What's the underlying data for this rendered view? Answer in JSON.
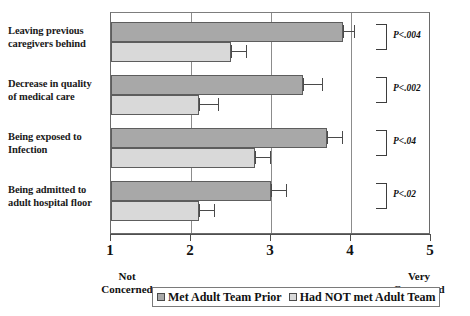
{
  "chart_data": {
    "type": "bar",
    "orientation": "horizontal",
    "title": "",
    "xlabel": "",
    "ylabel": "",
    "xlim": [
      1,
      5
    ],
    "xticks": [
      1,
      2,
      3,
      4,
      5
    ],
    "xtick_labels": [
      "1",
      "2",
      "3",
      "4",
      "5"
    ],
    "grid": true,
    "legend_position": "bottom",
    "categories": [
      "Leaving previous caregivers behind",
      "Decrease in quality of medical care",
      "Being exposed to Infection",
      "Being admitted to adult hospital floor"
    ],
    "category_label_lines": [
      [
        "Leaving previous",
        "caregivers behind"
      ],
      [
        "Decrease in quality",
        "of medical care"
      ],
      [
        "Being exposed to",
        "Infection"
      ],
      [
        "Being admitted to",
        "adult hospital floor"
      ]
    ],
    "series": [
      {
        "name": "Met Adult Team Prior",
        "color": "#a8a8a8",
        "values": [
          3.9,
          3.4,
          3.7,
          3.0
        ],
        "errors": [
          0.15,
          0.25,
          0.2,
          0.2
        ]
      },
      {
        "name": "Had NOT met Adult Team",
        "color": "#d9d9d9",
        "values": [
          2.5,
          2.1,
          2.8,
          2.1
        ],
        "errors": [
          0.2,
          0.25,
          0.2,
          0.2
        ]
      }
    ],
    "annotations": [
      {
        "label": "P<.004",
        "category": "Leaving previous caregivers behind"
      },
      {
        "label": "P<.002",
        "category": "Decrease in quality of medical care"
      },
      {
        "label": "P<.04",
        "category": "Being exposed to Infection"
      },
      {
        "label": "P<.02",
        "category": "Being admitted to adult hospital floor"
      }
    ],
    "axis_anchors": {
      "low": "Not Concerned",
      "low_lines": [
        "Not",
        "Concerned"
      ],
      "high": "Very Concerned",
      "high_lines": [
        "Very",
        "Concerned"
      ]
    }
  },
  "legend": {
    "items": [
      {
        "label": "Met Adult Team Prior",
        "swatch": "dark"
      },
      {
        "label": "Had NOT met Adult Team",
        "swatch": "light"
      }
    ]
  },
  "colors": {
    "series_dark": "#a8a8a8",
    "series_light": "#d9d9d9",
    "axis": "#4f4f4f",
    "grid": "#8c8c8c",
    "text": "#111111"
  }
}
